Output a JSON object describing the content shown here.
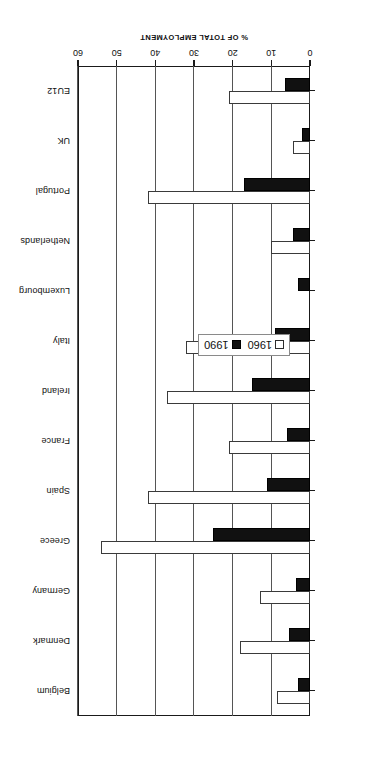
{
  "chart_data": {
    "type": "bar",
    "orientation": "horizontal",
    "title": "",
    "subtitle": "",
    "xlabel": "% OF TOTAL EMPLOYMENT",
    "ylabel": "",
    "xlim": [
      0,
      60
    ],
    "xticks": [
      0,
      10,
      20,
      30,
      40,
      50,
      60
    ],
    "xticklabels": [
      "0",
      "10",
      "20",
      "30",
      "40",
      "50",
      "60"
    ],
    "grid": true,
    "grid_axis": "x",
    "legend_position": "center-left-inside",
    "categories": [
      "Belgium",
      "Denmark",
      "Germany",
      "Greece",
      "Spain",
      "France",
      "Ireland",
      "Italy",
      "Luxembourg",
      "Netherlands",
      "Portugal",
      "UK",
      "EU12"
    ],
    "series": [
      {
        "name": "1960",
        "color": "#ffffff",
        "edge_color": "#3a3a3a",
        "values": [
          8.5,
          18.0,
          13.0,
          54.0,
          42.0,
          21.0,
          37.0,
          32.0,
          0.0,
          10.0,
          42.0,
          4.5,
          21.0
        ]
      },
      {
        "name": "1990",
        "color": "#111111",
        "edge_color": "#000000",
        "values": [
          3.0,
          5.5,
          3.5,
          25.0,
          11.0,
          6.0,
          15.0,
          9.0,
          3.0,
          4.5,
          17.0,
          2.0,
          6.5
        ]
      }
    ]
  },
  "legend": {
    "entries": [
      {
        "label": "1960",
        "swatch": "open-square-swatch"
      },
      {
        "label": "1990",
        "swatch": "filled-square-swatch"
      }
    ]
  },
  "axis": {
    "value_axis_title": "% OF TOTAL EMPLOYMENT"
  }
}
